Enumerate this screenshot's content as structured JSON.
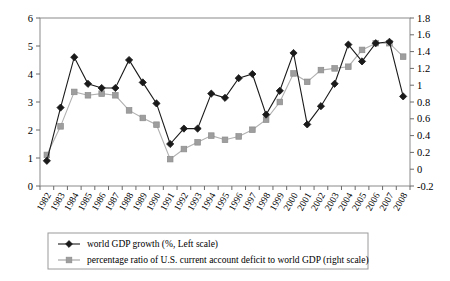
{
  "chart_data": {
    "type": "line",
    "title": "",
    "xlabel": "",
    "ylabel": "",
    "grid": true,
    "legend_position": "bottom",
    "categories": [
      "1982",
      "1983",
      "1984",
      "1985",
      "1986",
      "1987",
      "1988",
      "1989",
      "1990",
      "1991",
      "1992",
      "1993",
      "1994",
      "1995",
      "1996",
      "1997",
      "1998",
      "1999",
      "2000",
      "2001",
      "2002",
      "2003",
      "2004",
      "2005",
      "2006",
      "2007",
      "2008"
    ],
    "axes": {
      "left": {
        "label": "world GDP growth (%, Left scale)",
        "min": 0,
        "max": 6,
        "step": 1,
        "ticks": [
          "0",
          "1",
          "2",
          "3",
          "4",
          "5",
          "6"
        ]
      },
      "right": {
        "label": "percentage ratio of U.S. current account deficit to world GDP (right scale)",
        "min": -0.2,
        "max": 1.8,
        "step": 0.2,
        "ticks": [
          "-0.2",
          "0",
          "0.2",
          "0.4",
          "0.6",
          "0.8",
          "1",
          "1.2",
          "1.4",
          "1.6",
          "1.8"
        ]
      }
    },
    "series": [
      {
        "name": "world GDP growth  (%, Left scale)",
        "axis": "left",
        "marker": "diamond",
        "color": "#1a1a1a",
        "values": [
          0.9,
          2.8,
          4.6,
          3.65,
          3.5,
          3.5,
          4.5,
          3.7,
          2.95,
          1.5,
          2.05,
          2.05,
          3.3,
          3.15,
          3.85,
          4.0,
          2.55,
          3.4,
          4.75,
          2.2,
          2.85,
          3.65,
          5.05,
          4.45,
          5.1,
          5.15,
          3.2
        ]
      },
      {
        "name": "percentage ratio of U.S. current account deficit to world GDP (right scale)",
        "axis": "right",
        "marker": "square",
        "color": "#9e9e9e",
        "values": [
          0.17,
          0.51,
          0.92,
          0.88,
          0.9,
          0.88,
          0.7,
          0.61,
          0.53,
          0.12,
          0.24,
          0.32,
          0.4,
          0.35,
          0.39,
          0.47,
          0.59,
          0.8,
          1.14,
          1.04,
          1.18,
          1.2,
          1.22,
          1.42,
          1.5,
          1.5,
          1.34
        ]
      }
    ]
  },
  "legend": {
    "items": [
      {
        "label": "world GDP growth  (%, Left scale)",
        "marker": "diamond",
        "color": "#1a1a1a"
      },
      {
        "label": "percentage ratio of U.S. current account deficit to world GDP (right scale)",
        "marker": "square",
        "color": "#9e9e9e"
      }
    ]
  }
}
